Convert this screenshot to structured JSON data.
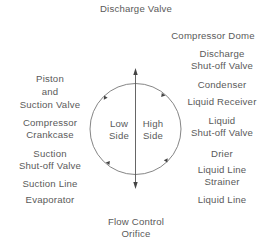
{
  "diagram": {
    "top_label": "Discharge Valve",
    "bottom_label": [
      "Flow Control",
      "Orifice"
    ],
    "center": {
      "left": [
        "Low",
        "Side"
      ],
      "right": [
        "High",
        "Side"
      ]
    },
    "left_labels": [
      [
        "Piston",
        "and",
        "Suction Valve"
      ],
      [
        "Compressor",
        "Crankcase"
      ],
      [
        "Suction",
        "Shut-off Valve"
      ],
      [
        "Suction Line"
      ],
      [
        "Evaporator"
      ]
    ],
    "right_labels": [
      [
        "Compressor Dome"
      ],
      [
        "Discharge",
        "Shut-off Valve"
      ],
      [
        "Condenser"
      ],
      [
        "Liquid Receiver"
      ],
      [
        "Liquid",
        "Shut-off Valve"
      ],
      [
        "Drier"
      ],
      [
        "Liquid Line",
        "Strainer"
      ],
      [
        "Liquid Line"
      ]
    ],
    "colors": {
      "line": "#6a6a6a",
      "text": "#5a5a5a"
    }
  }
}
